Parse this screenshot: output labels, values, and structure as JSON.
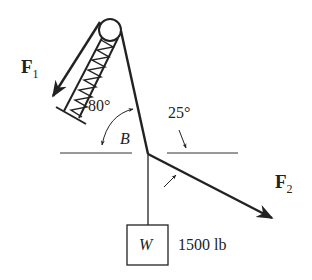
{
  "diagram": {
    "type": "statics-free-body",
    "labels": {
      "f1": "F",
      "f1_sub": "1",
      "f2": "F",
      "f2_sub": "2",
      "angle_80": "80°",
      "angle_25": "25°",
      "node": "B",
      "weight_symbol": "W",
      "weight_value": "1500 lb"
    },
    "colors": {
      "ink": "#222222",
      "background": "#ffffff"
    }
  }
}
